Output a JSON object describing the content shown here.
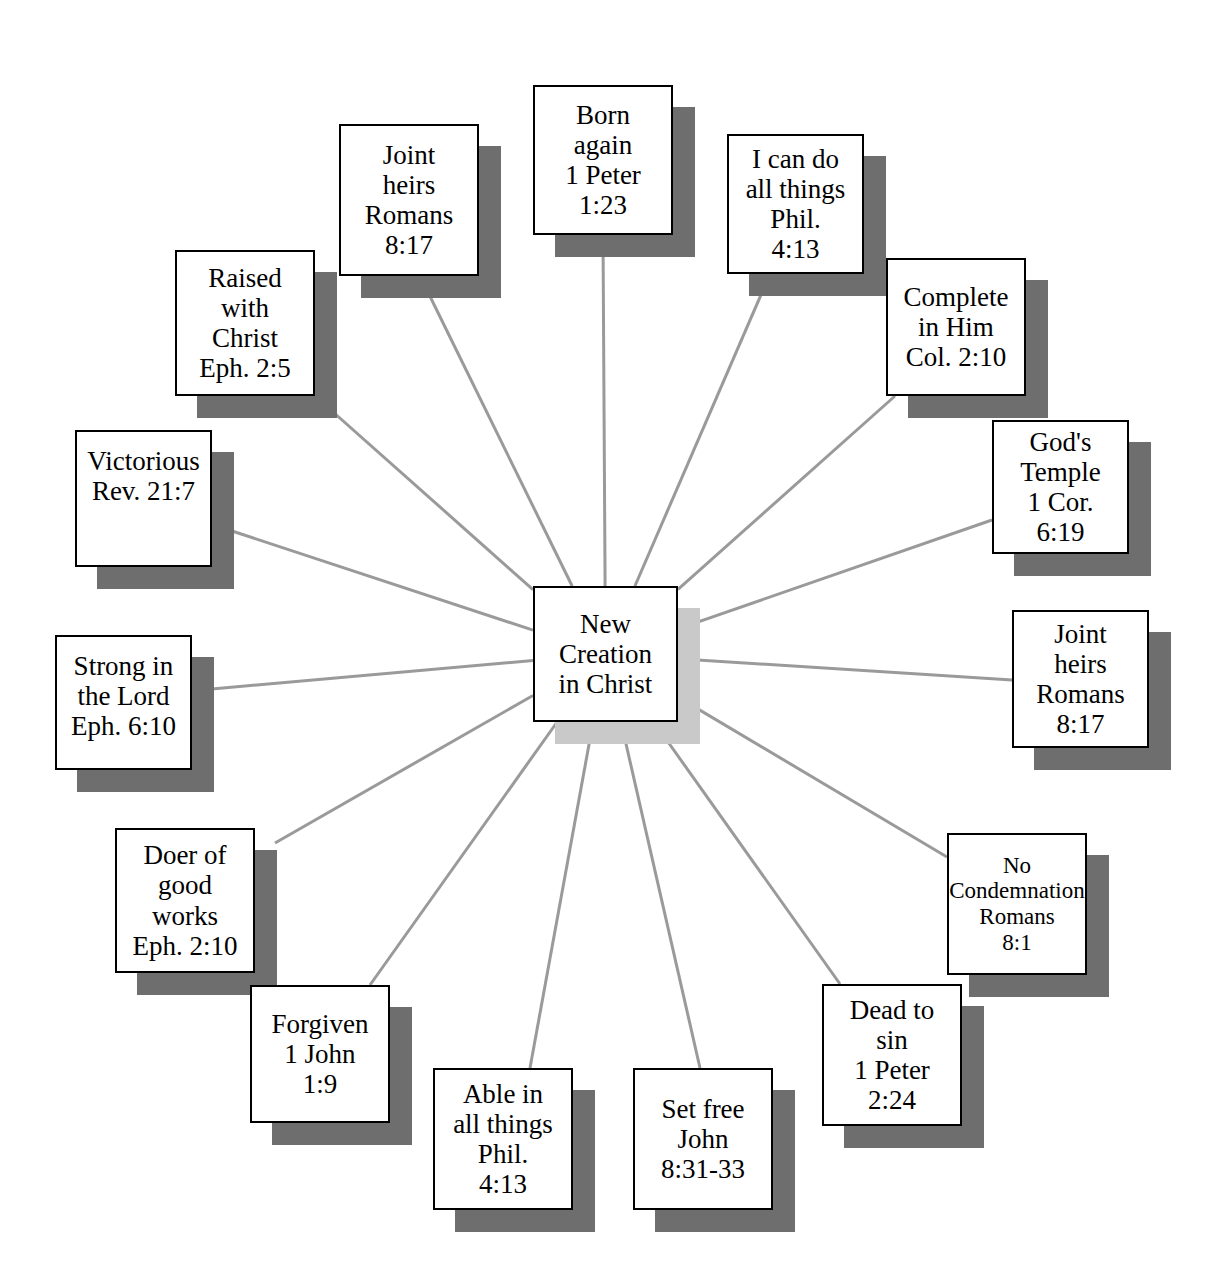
{
  "diagram": {
    "type": "radial-mind-map",
    "title_center": "New Creation in Christ",
    "center": {
      "name": "center-node",
      "lines": [
        "New",
        "Creation",
        "in Christ"
      ],
      "x": 533,
      "y": 586,
      "w": 145,
      "h": 136,
      "shadow_dx": 22,
      "shadow_dy": 22
    },
    "colors": {
      "box_fill": "#ffffff",
      "box_border": "#000000",
      "node_shadow": "#6e6e6e",
      "center_shadow": "#c9c9c9",
      "connector": "#9a9a9a",
      "text": "#000000",
      "background": "#ffffff"
    },
    "connector_width": 3,
    "nodes": [
      {
        "id": "born-again",
        "lines": [
          "Born",
          "again",
          "1 Peter",
          "1:23"
        ],
        "x": 533,
        "y": 85,
        "w": 140,
        "h": 150,
        "anchor_x": 603,
        "anchor_y": 235,
        "align": "center",
        "size": "normal"
      },
      {
        "id": "joint-heirs-top",
        "lines": [
          "Joint",
          "heirs",
          "Romans",
          "8:17"
        ],
        "x": 339,
        "y": 124,
        "w": 140,
        "h": 152,
        "anchor_x": 420,
        "anchor_y": 276,
        "align": "center",
        "size": "normal"
      },
      {
        "id": "raised-with-christ",
        "lines": [
          "Raised",
          "with",
          "Christ",
          "Eph. 2:5"
        ],
        "x": 175,
        "y": 250,
        "w": 140,
        "h": 146,
        "anchor_x": 315,
        "anchor_y": 396,
        "align": "center",
        "size": "normal"
      },
      {
        "id": "victorious",
        "lines": [
          "Victorious",
          "Rev. 21:7"
        ],
        "x": 75,
        "y": 430,
        "w": 137,
        "h": 137,
        "anchor_x": 232,
        "anchor_y": 531,
        "align": "top",
        "size": "normal"
      },
      {
        "id": "strong-in-the-lord",
        "lines": [
          "Strong in",
          "the Lord",
          "Eph. 6:10"
        ],
        "x": 55,
        "y": 635,
        "w": 137,
        "h": 135,
        "anchor_x": 212,
        "anchor_y": 689,
        "align": "top",
        "size": "normal"
      },
      {
        "id": "doer-of-good-works",
        "lines": [
          "Doer of",
          "good",
          "works",
          "Eph. 2:10"
        ],
        "x": 115,
        "y": 828,
        "w": 140,
        "h": 145,
        "anchor_x": 275,
        "anchor_y": 843,
        "align": "center",
        "size": "normal"
      },
      {
        "id": "forgiven",
        "lines": [
          "Forgiven",
          "1 John",
          "1:9"
        ],
        "x": 250,
        "y": 985,
        "w": 140,
        "h": 138,
        "anchor_x": 370,
        "anchor_y": 985,
        "align": "center",
        "size": "normal"
      },
      {
        "id": "able-in-all-things",
        "lines": [
          "Able in",
          "all things",
          "Phil.",
          "4:13"
        ],
        "x": 433,
        "y": 1068,
        "w": 140,
        "h": 142,
        "anchor_x": 530,
        "anchor_y": 1068,
        "align": "center",
        "size": "normal"
      },
      {
        "id": "set-free",
        "lines": [
          "Set free",
          "John",
          "8:31-33"
        ],
        "x": 633,
        "y": 1068,
        "w": 140,
        "h": 142,
        "anchor_x": 700,
        "anchor_y": 1068,
        "align": "center",
        "size": "normal"
      },
      {
        "id": "dead-to-sin",
        "lines": [
          "Dead to",
          "sin",
          "1 Peter",
          "2:24"
        ],
        "x": 822,
        "y": 984,
        "w": 140,
        "h": 142,
        "anchor_x": 840,
        "anchor_y": 984,
        "align": "center",
        "size": "normal"
      },
      {
        "id": "no-condemnation",
        "lines": [
          "No",
          "Condemnation",
          "Romans",
          "8:1"
        ],
        "x": 947,
        "y": 833,
        "w": 140,
        "h": 142,
        "anchor_x": 947,
        "anchor_y": 857,
        "align": "center",
        "size": "small"
      },
      {
        "id": "joint-heirs-right",
        "lines": [
          "Joint",
          "heirs",
          "Romans",
          "8:17"
        ],
        "x": 1012,
        "y": 610,
        "w": 137,
        "h": 138,
        "anchor_x": 1012,
        "anchor_y": 680,
        "align": "center",
        "size": "normal"
      },
      {
        "id": "gods-temple",
        "lines": [
          "God's",
          "Temple",
          "1 Cor.",
          "6:19"
        ],
        "x": 992,
        "y": 420,
        "w": 137,
        "h": 134,
        "anchor_x": 992,
        "anchor_y": 520,
        "align": "center",
        "size": "normal"
      },
      {
        "id": "complete-in-him",
        "lines": [
          "Complete",
          "in Him",
          "Col. 2:10"
        ],
        "x": 886,
        "y": 258,
        "w": 140,
        "h": 138,
        "anchor_x": 895,
        "anchor_y": 396,
        "align": "center",
        "size": "normal"
      },
      {
        "id": "i-can-do-all-things",
        "lines": [
          "I can do",
          "all things",
          "Phil.",
          "4:13"
        ],
        "x": 727,
        "y": 134,
        "w": 137,
        "h": 140,
        "anchor_x": 770,
        "anchor_y": 274,
        "align": "center",
        "size": "normal"
      }
    ]
  }
}
